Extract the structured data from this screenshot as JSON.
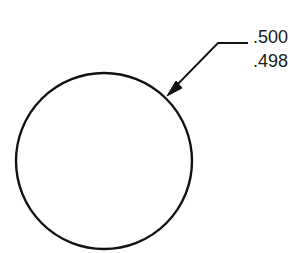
{
  "diagram": {
    "type": "dimensioned-circle",
    "circle": {
      "cx": 104,
      "cy": 161,
      "r": 88,
      "stroke": "#111111",
      "stroke_width": 2.4
    },
    "leader": {
      "shelf_start": [
        248,
        43
      ],
      "elbow": [
        218,
        43
      ],
      "tip": [
        167,
        96
      ],
      "stroke": "#111111"
    },
    "tolerance": {
      "upper_limit": ".500",
      "lower_limit": ".498"
    }
  }
}
